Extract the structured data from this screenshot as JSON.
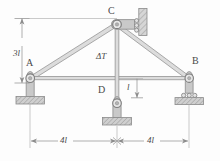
{
  "figure": {
    "background_color": "#fdfdfd",
    "line_color": "#8c8c8c",
    "member_fill": "#d8d8d8",
    "hatch_color": "#a8a8a8",
    "text_color": "#4a4a4a"
  },
  "joints": [
    {
      "id": "A",
      "label": "A",
      "x": 30,
      "y": 78,
      "support": "pin"
    },
    {
      "id": "B",
      "label": "B",
      "x": 189,
      "y": 78,
      "support": "roller"
    },
    {
      "id": "C",
      "label": "C",
      "x": 117,
      "y": 24,
      "support": "roller-wall"
    },
    {
      "id": "D",
      "label": "D",
      "x": 117,
      "y": 103,
      "support": "pin"
    }
  ],
  "joint_labels": [
    {
      "text": "A",
      "x": 26,
      "y": 60
    },
    {
      "text": "B",
      "x": 192,
      "y": 58
    },
    {
      "text": "C",
      "x": 108,
      "y": 7
    },
    {
      "text": "D",
      "x": 98,
      "y": 86
    }
  ],
  "members": [
    {
      "from": "A",
      "to": "C"
    },
    {
      "from": "C",
      "to": "B"
    },
    {
      "from": "A",
      "to": "B"
    },
    {
      "from": "C",
      "to": "D"
    }
  ],
  "load": {
    "label": "ΔT",
    "applies_to": "C-D",
    "x": 96,
    "y": 54
  },
  "dimensions": [
    {
      "name": "height",
      "label": "3l",
      "orientation": "vertical",
      "x": 22,
      "y": 40,
      "from_y": 24,
      "to_y": 78,
      "axis_x": 22
    },
    {
      "name": "offset",
      "label": "l",
      "orientation": "vertical",
      "x": 131,
      "y": 84,
      "from_y": 78,
      "to_y": 98,
      "axis_x": 137
    },
    {
      "name": "span-left",
      "label": "4l",
      "orientation": "horizontal",
      "x": 61,
      "y": 132,
      "from_x": 30,
      "to_x": 117,
      "axis_y": 141
    },
    {
      "name": "span-right",
      "label": "4l",
      "orientation": "horizontal",
      "x": 148,
      "y": 132,
      "from_x": 117,
      "to_x": 189,
      "axis_y": 141
    }
  ]
}
